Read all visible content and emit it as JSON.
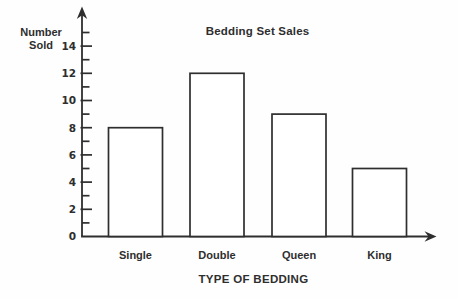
{
  "figure": {
    "title": "Bedding Set Sales",
    "y_axis_label": [
      "Number",
      "Sold"
    ],
    "x_axis_label": "TYPE OF BEDDING"
  },
  "colors": {
    "ink": "#2e2e2e",
    "background": "#fefefe",
    "bar_fill": "#ffffff"
  },
  "chart_data": {
    "type": "bar",
    "title": "Bedding Set Sales",
    "categories": [
      "Single",
      "Double",
      "Queen",
      "King"
    ],
    "values": [
      8,
      12,
      9,
      5
    ],
    "xlabel": "TYPE OF BEDDING",
    "ylabel": "Number Sold",
    "ylim": [
      0,
      15
    ],
    "yticks_labeled": [
      0,
      2,
      4,
      6,
      8,
      10,
      12,
      14
    ],
    "ytick_minor_step": 1,
    "grid": false,
    "legend": null
  }
}
